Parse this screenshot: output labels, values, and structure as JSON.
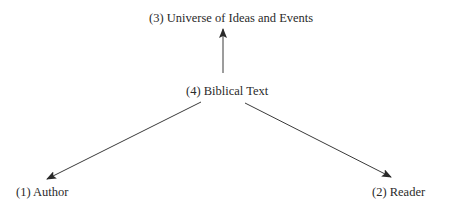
{
  "diagram": {
    "nodes": [
      {
        "id": "author",
        "label": "(1) Author"
      },
      {
        "id": "reader",
        "label": "(2) Reader"
      },
      {
        "id": "universe",
        "label": "(3) Universe of Ideas and Events"
      },
      {
        "id": "text",
        "label": "(4) Biblical Text"
      }
    ],
    "edges": [
      {
        "from": "text",
        "to": "universe"
      },
      {
        "from": "text",
        "to": "author"
      },
      {
        "from": "text",
        "to": "reader"
      }
    ],
    "colors": {
      "line": "#3a3a3a",
      "text": "#2a2a2a",
      "background": "#ffffff"
    }
  }
}
